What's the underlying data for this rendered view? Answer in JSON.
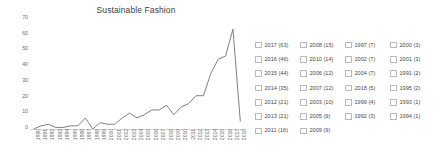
{
  "chart_data": {
    "type": "line",
    "title": "Sustainable Fashion",
    "xlabel": "",
    "ylabel": "",
    "ylim": [
      0,
      70
    ],
    "yticks": [
      0,
      10,
      20,
      30,
      40,
      50,
      60,
      70
    ],
    "grid": false,
    "legend_position": "right",
    "categories": [
      "1990",
      "1991",
      "1992",
      "1993",
      "1994",
      "1995",
      "1996",
      "1997",
      "1998",
      "1999",
      "2000",
      "2001",
      "2002",
      "2003",
      "2004",
      "2005",
      "2006",
      "2007",
      "2008",
      "2009",
      "2010",
      "2011",
      "2012",
      "2013",
      "2014",
      "2015",
      "2016",
      "2017",
      "2018"
    ],
    "values": [
      0,
      2,
      3,
      1,
      1,
      2,
      2,
      7,
      0,
      4,
      3,
      3,
      7,
      10,
      7,
      9,
      12,
      12,
      15,
      9,
      14,
      16,
      21,
      21,
      35,
      44,
      46,
      63,
      5
    ],
    "series": [
      {
        "name": "Publications",
        "values": [
          0,
          2,
          3,
          1,
          1,
          2,
          2,
          7,
          0,
          4,
          3,
          3,
          7,
          10,
          7,
          9,
          12,
          12,
          15,
          9,
          14,
          16,
          21,
          21,
          35,
          44,
          46,
          63,
          5
        ]
      }
    ],
    "line_color": "#808080"
  },
  "chart": {
    "title": "Sustainable Fashion",
    "y_ticks": [
      "70",
      "60",
      "50",
      "40",
      "30",
      "20",
      "10",
      "0"
    ],
    "x_ticks": [
      "1990",
      "1991",
      "1992",
      "1993",
      "1994",
      "1995",
      "1996",
      "1997",
      "1998",
      "1999",
      "2000",
      "2001",
      "2002",
      "2003",
      "2004",
      "2005",
      "2006",
      "2007",
      "2008",
      "2009",
      "2010",
      "2011",
      "2012",
      "2013",
      "2014",
      "2015",
      "2016",
      "2017",
      "2018"
    ]
  },
  "legend": {
    "columns": [
      {
        "items": [
          {
            "label": "2017 (63)",
            "year": "2017",
            "count": 63,
            "checked": false
          },
          {
            "label": "2016 (46)",
            "year": "2016",
            "count": 46,
            "checked": false
          },
          {
            "label": "2015 (44)",
            "year": "2015",
            "count": 44,
            "checked": false
          },
          {
            "label": "2014 (35)",
            "year": "2014",
            "count": 35,
            "checked": false
          },
          {
            "label": "2012 (21)",
            "year": "2012",
            "count": 21,
            "checked": false
          },
          {
            "label": "2013 (21)",
            "year": "2013",
            "count": 21,
            "checked": false
          },
          {
            "label": "2011 (16)",
            "year": "2011",
            "count": 16,
            "checked": false
          }
        ]
      },
      {
        "items": [
          {
            "label": "2008 (15)",
            "year": "2008",
            "count": 15,
            "checked": false
          },
          {
            "label": "2010 (14)",
            "year": "2010",
            "count": 14,
            "checked": false
          },
          {
            "label": "2006 (12)",
            "year": "2006",
            "count": 12,
            "checked": false
          },
          {
            "label": "2007 (12)",
            "year": "2007",
            "count": 12,
            "checked": false
          },
          {
            "label": "2003 (10)",
            "year": "2003",
            "count": 10,
            "checked": false
          },
          {
            "label": "2005 (9)",
            "year": "2005",
            "count": 9,
            "checked": false
          },
          {
            "label": "2009 (9)",
            "year": "2009",
            "count": 9,
            "checked": false
          }
        ]
      },
      {
        "items": [
          {
            "label": "1997 (7)",
            "year": "1997",
            "count": 7,
            "checked": false
          },
          {
            "label": "2002 (7)",
            "year": "2002",
            "count": 7,
            "checked": false
          },
          {
            "label": "2004 (7)",
            "year": "2004",
            "count": 7,
            "checked": false
          },
          {
            "label": "2018 (5)",
            "year": "2018",
            "count": 5,
            "checked": false
          },
          {
            "label": "1999 (4)",
            "year": "1999",
            "count": 4,
            "checked": false
          },
          {
            "label": "1992 (3)",
            "year": "1992",
            "count": 3,
            "checked": false
          }
        ]
      },
      {
        "items": [
          {
            "label": "2000 (3)",
            "year": "2000",
            "count": 3,
            "checked": false
          },
          {
            "label": "2001 (3)",
            "year": "2001",
            "count": 3,
            "checked": false
          },
          {
            "label": "1991 (2)",
            "year": "1991",
            "count": 2,
            "checked": false
          },
          {
            "label": "1995 (2)",
            "year": "1995",
            "count": 2,
            "checked": false
          },
          {
            "label": "1993 (1)",
            "year": "1993",
            "count": 1,
            "checked": false
          },
          {
            "label": "1994 (1)",
            "year": "1994",
            "count": 1,
            "checked": false
          }
        ]
      }
    ]
  }
}
